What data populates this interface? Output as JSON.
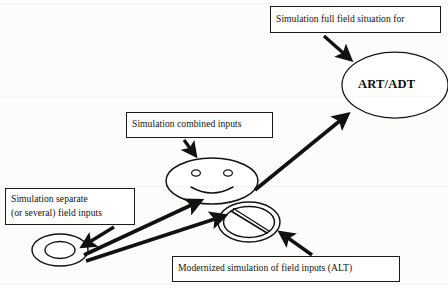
{
  "diagram": {
    "background_color": "#fcfcfa",
    "stroke_color": "#111111",
    "boxes": [
      {
        "id": "full_field",
        "name": "box-full-field",
        "lines": [
          "Simulation full field situation for"
        ],
        "x": 270,
        "y": 6,
        "width": 171,
        "height": 27
      },
      {
        "id": "combined",
        "name": "box-combined",
        "lines": [
          "Simulation combined inputs"
        ],
        "x": 126,
        "y": 112,
        "width": 147,
        "height": 26
      },
      {
        "id": "separate",
        "name": "box-separate",
        "lines": [
          "Simulation separate",
          "(or several) field inputs"
        ],
        "x": 5,
        "y": 188,
        "width": 130,
        "height": 37
      },
      {
        "id": "modernized",
        "name": "box-modernized",
        "lines": [
          "Modernized simulation of field inputs (ALT)"
        ],
        "x": 172,
        "y": 256,
        "width": 228,
        "height": 26
      }
    ],
    "nodes": [
      {
        "id": "art_adt",
        "name": "ellipse-art-adt",
        "shape": "ellipse",
        "label": "ART/ADT",
        "cx": 395,
        "cy": 85,
        "rx": 53,
        "ry": 33
      },
      {
        "id": "smiley",
        "name": "smiley-face-node",
        "shape": "smiley-ellipse",
        "label": "",
        "cx": 212,
        "cy": 181,
        "rx": 46,
        "ry": 23
      },
      {
        "id": "prohibition",
        "name": "prohibition-sign-node",
        "shape": "prohibition-ellipse",
        "label": "",
        "cx": 249,
        "cy": 222,
        "rx": 31,
        "ry": 20
      },
      {
        "id": "ring_oval",
        "name": "concentric-oval-node",
        "shape": "double-ellipse",
        "label": "",
        "cx": 60,
        "cy": 250,
        "rx": 28,
        "ry": 16
      }
    ],
    "arrows": [
      {
        "id": "full_field_to_art",
        "name": "arrow-full-field-to-art-adt",
        "from": "full_field",
        "to": "art_adt",
        "x1": 324,
        "y1": 36,
        "x2": 352,
        "y2": 61
      },
      {
        "id": "combined_to_smiley",
        "name": "arrow-combined-to-smiley",
        "from": "combined",
        "to": "smiley",
        "x1": 186,
        "y1": 140,
        "x2": 196,
        "y2": 158
      },
      {
        "id": "smiley_to_art",
        "name": "arrow-smiley-to-art-adt",
        "from": "smiley",
        "to": "art_adt",
        "x1": 254,
        "y1": 189,
        "x2": 349,
        "y2": 112
      },
      {
        "id": "separate_to_oval",
        "name": "arrow-separate-to-oval",
        "from": "separate",
        "to": "ring_oval",
        "x1": 112,
        "y1": 226,
        "x2": 80,
        "y2": 246
      },
      {
        "id": "oval_to_smiley",
        "name": "arrow-oval-to-smiley",
        "from": "ring_oval",
        "to": "smiley",
        "x1": 84,
        "y1": 254,
        "x2": 203,
        "y2": 202
      },
      {
        "id": "oval_to_prohibition",
        "name": "arrow-oval-to-prohibition",
        "from": "ring_oval",
        "to": "prohibition",
        "x1": 86,
        "y1": 259,
        "x2": 227,
        "y2": 217
      },
      {
        "id": "modernized_to_prohibition",
        "name": "arrow-modernized-to-prohibition",
        "from": "modernized",
        "to": "prohibition",
        "x1": 310,
        "y1": 254,
        "x2": 279,
        "y2": 232
      }
    ]
  }
}
